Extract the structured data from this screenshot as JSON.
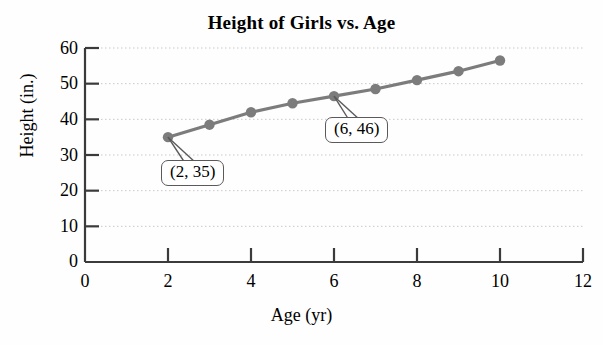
{
  "chart_data": {
    "type": "line",
    "title": "Height of Girls vs. Age",
    "xlabel": "Age (yr)",
    "ylabel": "Height (in.)",
    "xlim": [
      0,
      12
    ],
    "ylim": [
      0,
      60
    ],
    "xticks": [
      "0",
      "2",
      "4",
      "6",
      "8",
      "10",
      "12"
    ],
    "xtick_values": [
      0,
      2,
      4,
      6,
      8,
      10,
      12
    ],
    "yticks": [
      "0",
      "10",
      "20",
      "30",
      "40",
      "50",
      "60"
    ],
    "ytick_values": [
      0,
      10,
      20,
      30,
      40,
      50,
      60
    ],
    "grid": true,
    "grid_axis": "y",
    "legend": "none",
    "series": [
      {
        "name": "Height of girls",
        "x": [
          2,
          3,
          4,
          5,
          6,
          7,
          8,
          9,
          10
        ],
        "values": [
          35,
          38.5,
          42,
          44.5,
          46.5,
          48.5,
          51,
          53.5,
          56.5
        ],
        "marker": "circle",
        "color": "#7c7c7c"
      }
    ],
    "annotations": [
      {
        "label": "(2, 35)",
        "point_x": 2,
        "point_y": 35
      },
      {
        "label": "(6, 46)",
        "point_x": 6,
        "point_y": 46.5
      }
    ],
    "colors": {
      "series": "#7c7c7c",
      "axis": "#3b3b3b",
      "grid": "#c9c9c9",
      "text": "#000000",
      "background": "#fefefe"
    }
  }
}
